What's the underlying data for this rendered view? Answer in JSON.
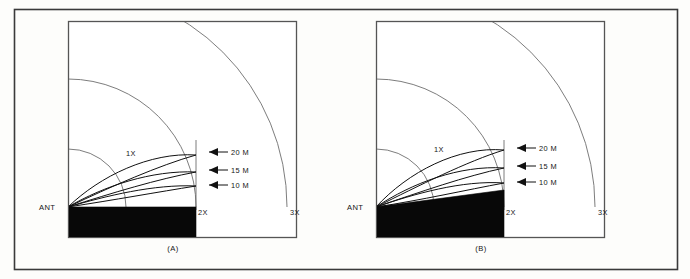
{
  "figure": {
    "background_color": "#fdfdfb",
    "frame_color": "#3a3a3a",
    "line_color": "#111111",
    "arc_color": "#6e6e6e",
    "ground_color": "#080808"
  },
  "panels": [
    {
      "id": "A",
      "caption": "(A)",
      "ground_type": "flat",
      "origin_label": "ANT",
      "range_arcs": [
        {
          "label": "1X",
          "radius_multiple": 1
        },
        {
          "label": "2X",
          "radius_multiple": 2
        },
        {
          "label": "3X",
          "radius_multiple": 3
        }
      ],
      "lobes": [
        {
          "label": "20 M",
          "band_meters": 20
        },
        {
          "label": "15 M",
          "band_meters": 15
        },
        {
          "label": "10 M",
          "band_meters": 10
        }
      ]
    },
    {
      "id": "B",
      "caption": "(B)",
      "ground_type": "sloping",
      "origin_label": "ANT",
      "range_arcs": [
        {
          "label": "1X",
          "radius_multiple": 1
        },
        {
          "label": "2X",
          "radius_multiple": 2
        },
        {
          "label": "3X",
          "radius_multiple": 3
        }
      ],
      "lobes": [
        {
          "label": "20 M",
          "band_meters": 20
        },
        {
          "label": "15 M",
          "band_meters": 15
        },
        {
          "label": "10 M",
          "band_meters": 10
        }
      ]
    }
  ],
  "labels": {
    "ant": "ANT",
    "x1": "1X",
    "x2": "2X",
    "x3": "3X",
    "m20": "20 M",
    "m15": "15 M",
    "m10": "10 M",
    "capA": "(A)",
    "capB": "(B)"
  }
}
